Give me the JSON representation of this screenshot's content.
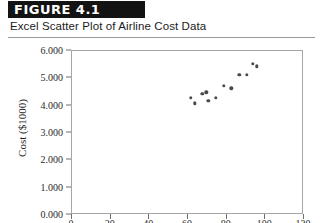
{
  "figure": {
    "number_label": "FIGURE 4.1",
    "caption": "Excel Scatter Plot of Airline Cost Data"
  },
  "chart_data": {
    "type": "scatter",
    "title": "Excel Scatter Plot of Airline Cost Data",
    "xlabel": "",
    "ylabel": "Cost ($1000)",
    "xlim": [
      0,
      120
    ],
    "ylim": [
      0,
      6000
    ],
    "xticks": [
      0,
      20,
      40,
      60,
      80,
      100,
      120
    ],
    "xtick_labels": [
      "0",
      "20",
      "40",
      "60",
      "80",
      "100",
      "120"
    ],
    "yticks": [
      0,
      1000,
      2000,
      3000,
      4000,
      5000,
      6000
    ],
    "ytick_labels": [
      "0.000",
      "1.000",
      "2.000",
      "3.000",
      "4.000",
      "5.000",
      "6.000"
    ],
    "grid": false,
    "legend": null,
    "marker_color": "#4a4a4a",
    "series": [
      {
        "name": "Airline Cost Data",
        "points": [
          [
            62,
            4250
          ],
          [
            64,
            4050
          ],
          [
            68,
            4400
          ],
          [
            70,
            4450
          ],
          [
            71,
            4150
          ],
          [
            75,
            4250
          ],
          [
            79,
            4700
          ],
          [
            83,
            4600
          ],
          [
            87,
            5100
          ],
          [
            91,
            5100
          ],
          [
            94,
            5500
          ],
          [
            96,
            5400
          ]
        ]
      }
    ]
  },
  "colors": {
    "header_bar": "#131313",
    "header_text": "#ffffff",
    "axis": "#a6a6a6",
    "marker": "#4a4a4a"
  }
}
